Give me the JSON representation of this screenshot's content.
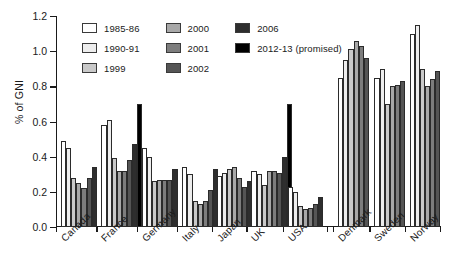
{
  "chart_data": {
    "type": "bar",
    "title": "",
    "subtitle": "",
    "xlabel": "",
    "ylabel": "% of GNI",
    "ylim": [
      0.0,
      1.2
    ],
    "yticks": [
      "0.0",
      "0.2",
      "0.4",
      "0.6",
      "0.8",
      "1.0",
      "1.2"
    ],
    "ytick_values": [
      0.0,
      0.2,
      0.4,
      0.6,
      0.8,
      1.0,
      1.2
    ],
    "grid": false,
    "legend_position": "top-left inside plot",
    "categories": [
      "Canada",
      "France",
      "Germany",
      "Italy",
      "Japan",
      "UK",
      "USA",
      "Denmark",
      "Sweden",
      "Norway"
    ],
    "series": [
      {
        "name": "1985-86",
        "color": "#ffffff",
        "values": [
          0.49,
          0.58,
          0.45,
          0.34,
          0.29,
          0.32,
          0.23,
          0.85,
          0.85,
          1.1
        ]
      },
      {
        "name": "1990-91",
        "color": "#ededed",
        "values": [
          0.45,
          0.61,
          0.4,
          0.3,
          0.31,
          0.3,
          0.2,
          0.95,
          0.9,
          1.15
        ]
      },
      {
        "name": "1999",
        "color": "#c9c9c9",
        "values": [
          0.28,
          0.39,
          0.26,
          0.15,
          0.33,
          0.24,
          0.12,
          1.01,
          0.7,
          0.9
        ]
      },
      {
        "name": "2000",
        "color": "#a8a8a8",
        "values": [
          0.25,
          0.32,
          0.27,
          0.13,
          0.34,
          0.32,
          0.1,
          1.06,
          0.8,
          0.8
        ]
      },
      {
        "name": "2001",
        "color": "#7d7d7d",
        "values": [
          0.22,
          0.32,
          0.27,
          0.15,
          0.28,
          0.32,
          0.11,
          1.03,
          0.81,
          0.84
        ]
      },
      {
        "name": "2002",
        "color": "#555555",
        "values": [
          0.28,
          0.38,
          0.27,
          0.21,
          0.23,
          0.31,
          0.13,
          0.96,
          0.83,
          0.89
        ]
      },
      {
        "name": "2006",
        "color": "#2e2e2e",
        "values": [
          0.34,
          0.47,
          0.33,
          0.33,
          0.26,
          0.4,
          0.17,
          null,
          null,
          null
        ]
      },
      {
        "name": "2012-13 (promised)",
        "color": "#000000",
        "values": [
          null,
          0.7,
          null,
          null,
          null,
          0.7,
          null,
          null,
          null,
          null
        ]
      }
    ]
  },
  "legend": {
    "items": [
      {
        "label": "1985-86",
        "color": "#ffffff"
      },
      {
        "label": "1990-91",
        "color": "#ededed"
      },
      {
        "label": "1999",
        "color": "#c9c9c9"
      },
      {
        "label": "2000",
        "color": "#a8a8a8"
      },
      {
        "label": "2001",
        "color": "#7d7d7d"
      },
      {
        "label": "2002",
        "color": "#555555"
      },
      {
        "label": "2006",
        "color": "#2e2e2e"
      },
      {
        "label": "2012-13 (promised)",
        "color": "#000000"
      }
    ]
  }
}
